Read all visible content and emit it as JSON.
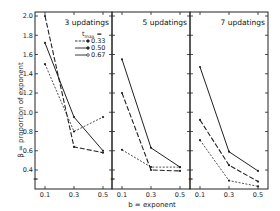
{
  "chart_data": {
    "type": "line",
    "ylabel": "β = proportion of exponent",
    "xlabel": "b = exponent",
    "ylim": [
      0.3,
      2.05
    ],
    "yticks": [
      0.4,
      0.6,
      0.8,
      1.0,
      1.2,
      1.4,
      1.6,
      1.8,
      2.0
    ],
    "ytick_labels": [
      "0.4",
      "0.6",
      "0.8",
      "1.0",
      "1.2",
      "1.4",
      "1.6",
      "1.8",
      "2.0"
    ],
    "x": [
      0.1,
      0.3,
      0.5
    ],
    "xtick_labels": [
      "0.1",
      "0.3",
      "0.5"
    ],
    "legend": {
      "title": "t_max =",
      "entries": [
        "0.33",
        "0.50",
        "0.67"
      ],
      "position": "upper right of first panel"
    },
    "grid": false,
    "panels": [
      {
        "title": "3 updatings",
        "series": [
          {
            "name": "0.33",
            "style": "short-dash",
            "values": [
              1.5,
              0.8,
              0.95
            ]
          },
          {
            "name": "0.50",
            "style": "long-dash",
            "values": [
              2.0,
              0.64,
              0.58
            ]
          },
          {
            "name": "0.67",
            "style": "solid",
            "values": [
              1.72,
              0.95,
              0.6
            ]
          }
        ]
      },
      {
        "title": "5 updatings",
        "series": [
          {
            "name": "0.33",
            "style": "short-dash",
            "values": [
              0.61,
              0.43,
              0.43
            ]
          },
          {
            "name": "0.50",
            "style": "long-dash",
            "values": [
              1.2,
              0.4,
              0.39
            ]
          },
          {
            "name": "0.67",
            "style": "solid",
            "values": [
              1.55,
              0.63,
              0.43
            ]
          }
        ]
      },
      {
        "title": "7 updatings",
        "series": [
          {
            "name": "0.33",
            "style": "short-dash",
            "values": [
              0.71,
              0.29,
              0.23
            ]
          },
          {
            "name": "0.50",
            "style": "long-dash",
            "values": [
              0.92,
              0.45,
              0.28
            ]
          },
          {
            "name": "0.67",
            "style": "solid",
            "values": [
              1.47,
              0.59,
              0.39
            ]
          }
        ]
      }
    ]
  },
  "labels": {
    "ylabel": "β = proportion of exponent",
    "xlabel": "b = exponent",
    "legend_title": "t",
    "legend_sub": "max",
    "legend_eq": "="
  }
}
